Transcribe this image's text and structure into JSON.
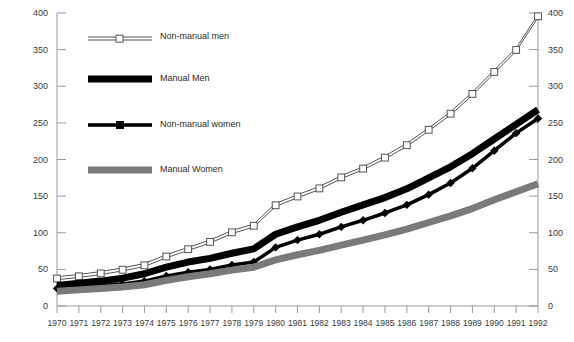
{
  "chart_data": {
    "type": "line",
    "title": "",
    "subtitle": "",
    "xlabel": "",
    "ylabel": "",
    "x": [
      1970,
      1971,
      1972,
      1973,
      1974,
      1975,
      1976,
      1977,
      1978,
      1979,
      1980,
      1981,
      1982,
      1983,
      1984,
      1985,
      1986,
      1987,
      1988,
      1989,
      1990,
      1991,
      1992
    ],
    "categories": [
      "1970",
      "1971",
      "1972",
      "1973",
      "1974",
      "1975",
      "1976",
      "1977",
      "1978",
      "1979",
      "1980",
      "1981",
      "1982",
      "1983",
      "1984",
      "1985",
      "1986",
      "1987",
      "1988",
      "1989",
      "1990",
      "1991",
      "1992"
    ],
    "xlim": [
      1970,
      1992
    ],
    "ylim": [
      0,
      400
    ],
    "y_ticks": [
      0,
      50,
      100,
      150,
      200,
      250,
      300,
      350,
      400
    ],
    "y_ticks_left": [
      "0",
      "50",
      "100",
      "150",
      "200",
      "250",
      "300",
      "350",
      "400"
    ],
    "y_ticks_right": [
      "0",
      "50",
      "100",
      "150",
      "200",
      "250",
      "300",
      "350",
      "400"
    ],
    "grid": false,
    "legend_position": "upper-left-inside",
    "series": [
      {
        "name": "Non-manual men",
        "key": "non_manual_men",
        "marker": "open-square",
        "color": "#555555",
        "fill": "#ffffff",
        "line_width": 1,
        "values": [
          40,
          43,
          47,
          52,
          58,
          70,
          80,
          90,
          103,
          112,
          140,
          152,
          163,
          178,
          190,
          205,
          222,
          243,
          265,
          292,
          322,
          352,
          398
        ]
      },
      {
        "name": "Manual Men",
        "key": "manual_men",
        "marker": "none",
        "color": "#000000",
        "line_width": 7,
        "values": [
          28,
          31,
          34,
          38,
          44,
          53,
          60,
          65,
          72,
          78,
          98,
          108,
          117,
          128,
          138,
          148,
          160,
          175,
          190,
          208,
          228,
          248,
          268
        ]
      },
      {
        "name": "Non-manual women",
        "key": "non_manual_women",
        "marker": "filled-diamond",
        "color": "#000000",
        "line_width": 3.5,
        "values": [
          24,
          26,
          28,
          30,
          34,
          41,
          46,
          50,
          56,
          60,
          80,
          90,
          98,
          108,
          117,
          127,
          138,
          152,
          168,
          188,
          212,
          236,
          256
        ]
      },
      {
        "name": "Manual Women",
        "key": "manual_women",
        "marker": "none",
        "color": "#7a7a7a",
        "line_width": 7,
        "values": [
          20,
          22,
          24,
          26,
          29,
          35,
          40,
          44,
          49,
          53,
          63,
          70,
          76,
          83,
          90,
          97,
          105,
          114,
          123,
          133,
          145,
          156,
          167
        ]
      }
    ],
    "legend": [
      {
        "label": "Non-manual men",
        "style": "open-square-thin-line",
        "color": "#555555"
      },
      {
        "label": "Manual Men",
        "style": "thick-black-bar",
        "color": "#000000"
      },
      {
        "label": "Non-manual women",
        "style": "filled-square-medium-line",
        "color": "#000000"
      },
      {
        "label": "Manual Women",
        "style": "thick-gray-bar",
        "color": "#7a7a7a"
      }
    ]
  },
  "axes": {
    "left_tick_labels": [
      "400",
      "350",
      "300",
      "250",
      "200",
      "150",
      "100",
      "50",
      "0"
    ],
    "right_tick_labels": [
      "400",
      "350",
      "300",
      "250",
      "200",
      "150",
      "100",
      "50",
      "0"
    ],
    "x_tick_labels": [
      "1970",
      "1971",
      "1972",
      "1973",
      "1974",
      "1975",
      "1976",
      "1977",
      "1978",
      "1979",
      "1980",
      "1981",
      "1982",
      "1983",
      "1984",
      "1985",
      "1986",
      "1987",
      "1988",
      "1989",
      "1990",
      "1991",
      "1992"
    ]
  },
  "colors": {
    "axis": "#9a9a9a",
    "text": "#3a3a3a",
    "series_open": "#555555",
    "series_black": "#000000",
    "series_gray": "#7a7a7a",
    "background": "#ffffff"
  }
}
